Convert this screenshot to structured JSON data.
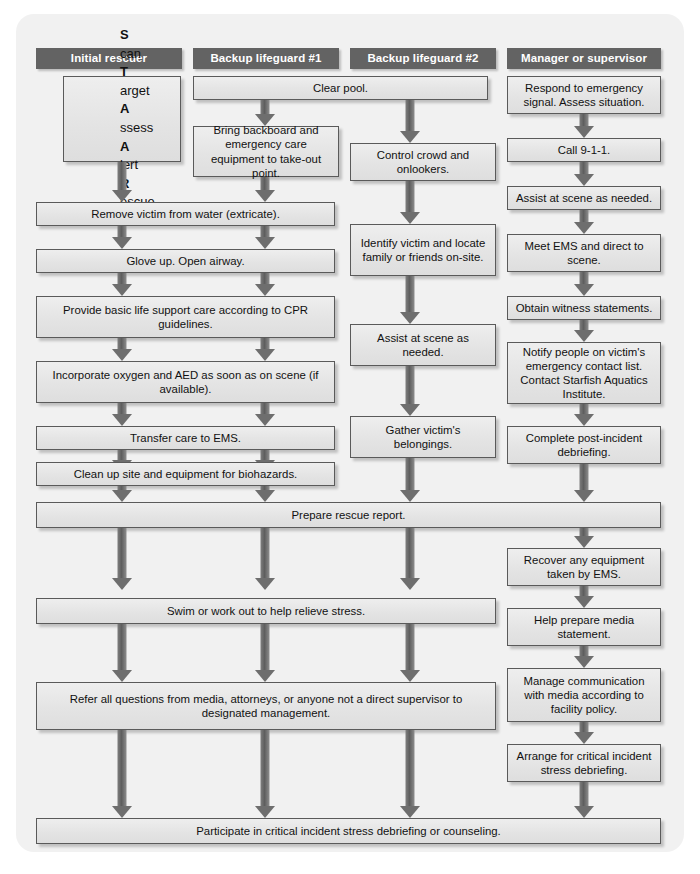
{
  "diagram": {
    "colors": {
      "header_bar": "#636363",
      "box_fill": "#e6e6e6",
      "box_border": "#5a5a5a",
      "arrow": "#6e6e6e",
      "panel_background": "#f1f1f1"
    }
  },
  "columns": [
    {
      "id": "initial-rescuer",
      "header": "Initial rescuer"
    },
    {
      "id": "backup-lifeguard-1",
      "header": "Backup lifeguard #1"
    },
    {
      "id": "backup-lifeguard-2",
      "header": "Backup lifeguard #2"
    },
    {
      "id": "manager",
      "header": "Manager or supervisor"
    }
  ],
  "acronym": {
    "lines": [
      {
        "initial": "S",
        "rest": "can"
      },
      {
        "initial": "T",
        "rest": "arget"
      },
      {
        "initial": "A",
        "rest": "ssess"
      },
      {
        "initial": "A",
        "rest": "lert"
      },
      {
        "initial": "R",
        "rest": "escue"
      }
    ]
  },
  "steps": {
    "col1": [
      "Remove victim from water (extricate).",
      "Glove up. Open airway.",
      "Provide basic life support care according to CPR guidelines.",
      "Incorporate oxygen and AED as soon as on scene (if available).",
      "Transfer care to EMS.",
      "Clean up site and equipment for biohazards."
    ],
    "col2": [
      "Clear pool.",
      "Bring backboard and emergency care equipment to take-out point."
    ],
    "col3": [
      "Control crowd and onlookers.",
      "Identify victim and locate family or friends on-site.",
      "Assist at scene as needed.",
      "Gather victim's belongings."
    ],
    "col4": [
      "Respond to emergency signal. Assess situation.",
      "Call 9-1-1.",
      "Assist at scene as needed.",
      "Meet EMS and direct to scene.",
      "Obtain witness statements.",
      "Notify people on victim's emergency contact list. Contact Starfish Aquatics Institute.",
      "Complete post-incident debriefing.",
      "Recover any equipment taken by EMS.",
      "Help prepare media statement.",
      "Manage communication with media according to facility policy.",
      "Arrange for critical incident stress debriefing."
    ]
  },
  "shared_steps": [
    {
      "id": "prepare-rescue-report",
      "text": "Prepare rescue report.",
      "spans": "all-four-columns"
    },
    {
      "id": "swim-or-work-out",
      "text": "Swim or work out to help relieve stress.",
      "spans": "first-three-columns"
    },
    {
      "id": "refer-all-questions",
      "text": "Refer all questions from media, attorneys, or anyone not a direct supervisor to designated management.",
      "spans": "first-three-columns"
    },
    {
      "id": "participate-debriefing",
      "text": "Participate in critical incident stress debriefing or counseling.",
      "spans": "all-four-columns"
    }
  ]
}
